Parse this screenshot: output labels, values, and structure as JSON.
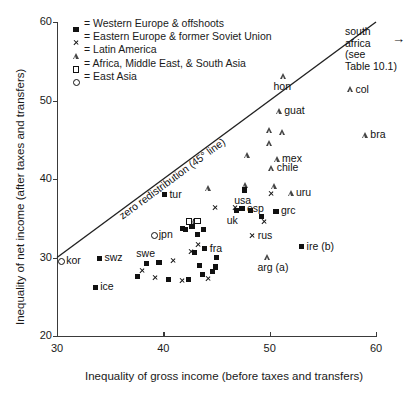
{
  "chart_data": {
    "type": "scatter",
    "title": "",
    "xlabel": "Inequality of gross income (before taxes and transfers)",
    "ylabel": "Inequality of net income (after taxes and transfers)",
    "xlim": [
      30,
      60
    ],
    "ylim": [
      20,
      60
    ],
    "xticks": [
      30,
      40,
      50,
      60
    ],
    "yticks": [
      20,
      30,
      40,
      50,
      60
    ],
    "grid": false,
    "legend_position": "top-left",
    "legend": [
      {
        "marker": "filled-square",
        "label": "= Western Europe & offshoots"
      },
      {
        "marker": "cross",
        "label": "= Eastern Europe & former Soviet Union"
      },
      {
        "marker": "triangle",
        "label": "= Latin America"
      },
      {
        "marker": "open-square",
        "label": "= Africa, Middle East, & South Asia"
      },
      {
        "marker": "circle",
        "label": "= East Asia"
      }
    ],
    "reference_line": {
      "label": "zero redistribution (45° line)",
      "slope": 1,
      "intercept": 0
    },
    "annotations": [
      {
        "text_lines": [
          "south",
          "africa",
          "(see",
          "Table 10.1)"
        ],
        "arrow": "→"
      }
    ],
    "points": [
      {
        "label": "col",
        "marker": "triangle",
        "x": 57.6,
        "y": 51.4,
        "label_pos": "right"
      },
      {
        "label": "hon",
        "marker": "triangle",
        "x": 51.3,
        "y": 53.1,
        "label_pos": "below"
      },
      {
        "label": "guat",
        "marker": "triangle",
        "x": 50.9,
        "y": 48.6,
        "label_pos": "right"
      },
      {
        "label": "bra",
        "marker": "triangle",
        "x": 59.0,
        "y": 45.6,
        "label_pos": "right"
      },
      {
        "label": "",
        "marker": "triangle",
        "x": 50.0,
        "y": 46.2,
        "label_pos": "none"
      },
      {
        "label": "",
        "marker": "triangle",
        "x": 51.2,
        "y": 45.9,
        "label_pos": "none"
      },
      {
        "label": "",
        "marker": "triangle",
        "x": 50.0,
        "y": 44.5,
        "label_pos": "none"
      },
      {
        "label": "",
        "marker": "triangle",
        "x": 47.9,
        "y": 43.0,
        "label_pos": "none"
      },
      {
        "label": "mex",
        "marker": "triangle",
        "x": 50.7,
        "y": 42.5,
        "label_pos": "right"
      },
      {
        "label": "chile",
        "marker": "triangle",
        "x": 50.2,
        "y": 41.4,
        "label_pos": "right"
      },
      {
        "label": "",
        "marker": "triangle",
        "x": 47.7,
        "y": 39.2,
        "label_pos": "none"
      },
      {
        "label": "",
        "marker": "triangle",
        "x": 50.4,
        "y": 39.1,
        "label_pos": "none"
      },
      {
        "label": "",
        "marker": "triangle",
        "x": 44.2,
        "y": 38.8,
        "label_pos": "none"
      },
      {
        "label": "uru",
        "marker": "triangle",
        "x": 52.0,
        "y": 38.2,
        "label_pos": "right"
      },
      {
        "label": "arg (a)",
        "marker": "triangle",
        "x": 49.8,
        "y": 30.1,
        "label_pos": "below"
      },
      {
        "label": "",
        "marker": "triangle",
        "x": 42.9,
        "y": 34.6,
        "label_pos": "none"
      },
      {
        "label": "usa",
        "marker": "filled-square",
        "x": 47.6,
        "y": 38.6,
        "label_pos": "below"
      },
      {
        "label": "tur",
        "marker": "filled-square",
        "x": 40.1,
        "y": 38.0,
        "label_pos": "right"
      },
      {
        "label": "esp",
        "marker": "filled-square",
        "x": 47.4,
        "y": 36.2,
        "label_pos": "right"
      },
      {
        "label": "",
        "marker": "filled-square",
        "x": 48.2,
        "y": 36.0,
        "label_pos": "none"
      },
      {
        "label": "uk",
        "marker": "filled-square",
        "x": 46.9,
        "y": 36.0,
        "label_pos": "below"
      },
      {
        "label": "grc",
        "marker": "filled-square",
        "x": 50.6,
        "y": 35.9,
        "label_pos": "right"
      },
      {
        "label": "",
        "marker": "filled-square",
        "x": 49.2,
        "y": 35.2,
        "label_pos": "none"
      },
      {
        "label": "ire (b)",
        "marker": "filled-square",
        "x": 53.0,
        "y": 31.4,
        "label_pos": "right"
      },
      {
        "label": "",
        "marker": "filled-square",
        "x": 43.8,
        "y": 33.6,
        "label_pos": "none"
      },
      {
        "label": "",
        "marker": "filled-square",
        "x": 42.1,
        "y": 33.6,
        "label_pos": "none"
      },
      {
        "label": "",
        "marker": "filled-square",
        "x": 42.7,
        "y": 34.0,
        "label_pos": "none"
      },
      {
        "label": "",
        "marker": "filled-square",
        "x": 43.2,
        "y": 32.9,
        "label_pos": "none"
      },
      {
        "label": "fra",
        "marker": "filled-square",
        "x": 43.9,
        "y": 31.1,
        "label_pos": "right"
      },
      {
        "label": "",
        "marker": "filled-square",
        "x": 42.9,
        "y": 30.6,
        "label_pos": "none"
      },
      {
        "label": "swz",
        "marker": "filled-square",
        "x": 34.0,
        "y": 29.9,
        "label_pos": "right"
      },
      {
        "label": "swe",
        "marker": "filled-square",
        "x": 38.4,
        "y": 29.2,
        "label_pos": "above"
      },
      {
        "label": "",
        "marker": "filled-square",
        "x": 39.6,
        "y": 29.4,
        "label_pos": "none"
      },
      {
        "label": "",
        "marker": "filled-square",
        "x": 43.4,
        "y": 29.0,
        "label_pos": "none"
      },
      {
        "label": "",
        "marker": "filled-square",
        "x": 45.0,
        "y": 30.0,
        "label_pos": "none"
      },
      {
        "label": "",
        "marker": "filled-square",
        "x": 44.6,
        "y": 28.2,
        "label_pos": "none"
      },
      {
        "label": "",
        "marker": "filled-square",
        "x": 43.7,
        "y": 27.8,
        "label_pos": "none"
      },
      {
        "label": "",
        "marker": "filled-square",
        "x": 44.9,
        "y": 28.8,
        "label_pos": "none"
      },
      {
        "label": "",
        "marker": "filled-square",
        "x": 37.6,
        "y": 27.6,
        "label_pos": "none"
      },
      {
        "label": "",
        "marker": "filled-square",
        "x": 40.5,
        "y": 27.2,
        "label_pos": "none"
      },
      {
        "label": "",
        "marker": "filled-square",
        "x": 42.4,
        "y": 27.2,
        "label_pos": "none"
      },
      {
        "label": "ice",
        "marker": "filled-square",
        "x": 33.6,
        "y": 26.2,
        "label_pos": "right"
      },
      {
        "label": "",
        "marker": "filled-square",
        "x": 41.8,
        "y": 33.7,
        "label_pos": "none"
      },
      {
        "label": "rus",
        "marker": "cross",
        "x": 48.4,
        "y": 32.8,
        "label_pos": "right"
      },
      {
        "label": "",
        "marker": "cross",
        "x": 50.1,
        "y": 38.1,
        "label_pos": "none"
      },
      {
        "label": "",
        "marker": "cross",
        "x": 46.8,
        "y": 36.3,
        "label_pos": "none"
      },
      {
        "label": "",
        "marker": "cross",
        "x": 49.5,
        "y": 34.6,
        "label_pos": "none"
      },
      {
        "label": "",
        "marker": "cross",
        "x": 44.9,
        "y": 36.4,
        "label_pos": "none"
      },
      {
        "label": "",
        "marker": "cross",
        "x": 43.0,
        "y": 34.6,
        "label_pos": "none"
      },
      {
        "label": "",
        "marker": "cross",
        "x": 43.3,
        "y": 31.6,
        "label_pos": "none"
      },
      {
        "label": "",
        "marker": "cross",
        "x": 42.6,
        "y": 30.8,
        "label_pos": "none"
      },
      {
        "label": "",
        "marker": "cross",
        "x": 40.9,
        "y": 29.6,
        "label_pos": "none"
      },
      {
        "label": "",
        "marker": "cross",
        "x": 38.0,
        "y": 28.3,
        "label_pos": "none"
      },
      {
        "label": "",
        "marker": "cross",
        "x": 39.2,
        "y": 27.5,
        "label_pos": "none"
      },
      {
        "label": "",
        "marker": "cross",
        "x": 41.8,
        "y": 27.1,
        "label_pos": "none"
      },
      {
        "label": "",
        "marker": "cross",
        "x": 44.2,
        "y": 27.3,
        "label_pos": "none"
      },
      {
        "label": "jpn",
        "marker": "circle",
        "x": 39.1,
        "y": 32.9,
        "label_pos": "right"
      },
      {
        "label": "kor",
        "marker": "circle",
        "x": 30.4,
        "y": 29.5,
        "label_pos": "right"
      },
      {
        "label": "",
        "marker": "open-square",
        "x": 42.4,
        "y": 34.6,
        "label_pos": "none"
      },
      {
        "label": "",
        "marker": "open-square",
        "x": 43.2,
        "y": 34.7,
        "label_pos": "none"
      }
    ]
  },
  "colors": {
    "axis": "#3a3a3a",
    "marker": "#111111",
    "text": "#1a1a1a",
    "background": "#ffffff"
  }
}
